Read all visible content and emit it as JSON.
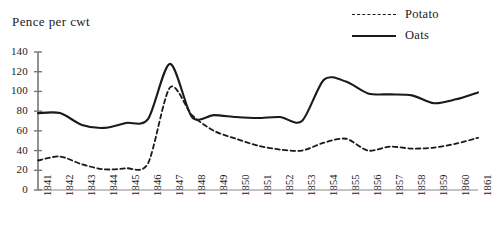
{
  "chart_data": {
    "type": "line",
    "title": "",
    "ylabel": "Pence per cwt",
    "xlabel": "",
    "ylim": [
      0,
      140
    ],
    "yticks": [
      0,
      20,
      40,
      60,
      80,
      100,
      120,
      140
    ],
    "grid": false,
    "legend_position": "top-right",
    "categories": [
      "1841",
      "1842",
      "1843",
      "1844",
      "1845",
      "1846",
      "1847",
      "1848",
      "1849",
      "1850",
      "1851",
      "1852",
      "1853",
      "1854",
      "1855",
      "1856",
      "1857",
      "1858",
      "1859",
      "1860",
      "1861"
    ],
    "series": [
      {
        "name": "Potato",
        "style": "dashed",
        "color": "#1a1a1a",
        "values": [
          30,
          34,
          26,
          21,
          22,
          27,
          104,
          76,
          60,
          52,
          45,
          41,
          40,
          48,
          52,
          40,
          44,
          42,
          43,
          47,
          53
        ]
      },
      {
        "name": "Oats",
        "style": "solid",
        "color": "#1a1a1a",
        "values": [
          78,
          78,
          66,
          63,
          68,
          72,
          128,
          74,
          76,
          74,
          73,
          74,
          70,
          112,
          110,
          98,
          97,
          96,
          88,
          92,
          99
        ]
      }
    ]
  },
  "axis": {
    "y_title": "Pence per cwt"
  },
  "legend": {
    "items": [
      {
        "label": "Potato",
        "style": "dashed"
      },
      {
        "label": "Oats",
        "style": "solid"
      }
    ]
  }
}
